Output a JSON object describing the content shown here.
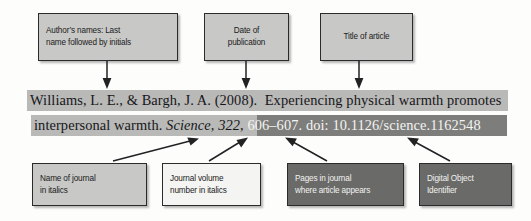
{
  "figure": {
    "type": "annotated-apa-reference-diagram",
    "colors": {
      "callout_light": "#c8c8c6",
      "callout_white": "#f4f4f2",
      "callout_dark": "#6a6a68",
      "highlight_light": "#b9b9b7",
      "highlight_dark": "#7d7d7b",
      "text": "#17171a",
      "arrow": "#222224"
    }
  },
  "citation": {
    "line1": {
      "authors": "Williams, L. E., & Bargh, J. A.",
      "year": "(2008).",
      "title_part1": "Experiencing physical warmth promotes",
      "full": "Williams, L. E., & Bargh, J. A. (2008).  Experiencing physical warmth promotes"
    },
    "line2": {
      "title_part2": "interpersonal warmth.",
      "journal": "Science,",
      "volume": "322",
      "volume_comma": ",",
      "pages": "606–607.",
      "doi_label": "doi:",
      "doi_value": "10.1126/science.1162548",
      "full": "interpersonal warmth. Science, 322, 606–607. doi: 10.1126/science.1162548"
    }
  },
  "callouts_top": [
    {
      "id": "authors",
      "label": "Author’s names: Last\nname followed by initials",
      "style": "light"
    },
    {
      "id": "date",
      "label": "Date of\npublication",
      "style": "light"
    },
    {
      "id": "title",
      "label": "Title of article",
      "style": "light"
    }
  ],
  "callouts_bottom": [
    {
      "id": "journal-name",
      "label": "Name of journal\nin italics",
      "style": "light"
    },
    {
      "id": "journal-volume",
      "label": "Journal volume\nnumber in italics",
      "style": "white"
    },
    {
      "id": "pages",
      "label": "Pages in journal\nwhere article appears",
      "style": "dark"
    },
    {
      "id": "doi",
      "label": "Digital Object\nIdentifier",
      "style": "dark"
    }
  ]
}
